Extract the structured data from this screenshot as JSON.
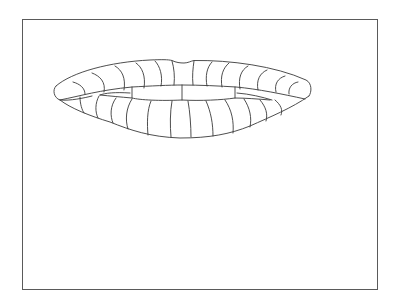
{
  "drawing": {
    "subject": "lips-with-teeth-line-art",
    "stroke_color": "#3a3a3a",
    "frame_color": "#5a5a5a",
    "background": "#ffffff"
  }
}
